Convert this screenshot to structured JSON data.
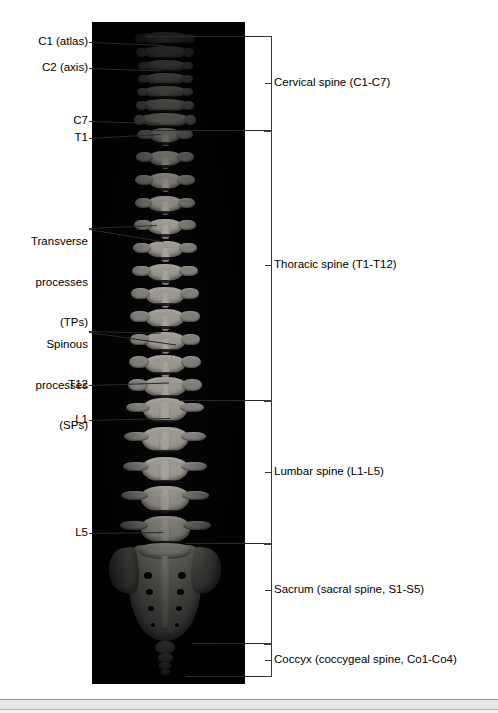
{
  "figure": {
    "background_color": "#ffffff",
    "photo_background_color": "#040404",
    "bone_color": "#8e8c87"
  },
  "left_labels": [
    {
      "id": "c1",
      "text": "C1 (atlas)",
      "lines": [
        "C1 (atlas)"
      ]
    },
    {
      "id": "c2",
      "text": "C2 (axis)",
      "lines": [
        "C2 (axis)"
      ]
    },
    {
      "id": "c7",
      "text": "C7",
      "lines": [
        "C7"
      ]
    },
    {
      "id": "t1",
      "text": "T1",
      "lines": [
        "T1"
      ]
    },
    {
      "id": "tp",
      "text": "Transverse processes (TPs)",
      "lines": [
        "Transverse",
        "processes",
        "(TPs)"
      ]
    },
    {
      "id": "sp",
      "text": "Spinous processes (SPs)",
      "lines": [
        "Spinous",
        "processes",
        "(SPs)"
      ]
    },
    {
      "id": "t12",
      "text": "T12",
      "lines": [
        "T12"
      ]
    },
    {
      "id": "l1",
      "text": "L1",
      "lines": [
        "L1"
      ]
    },
    {
      "id": "l5",
      "text": "L5",
      "lines": [
        "L5"
      ]
    }
  ],
  "right_labels": [
    {
      "id": "cervical",
      "text": "Cervical spine (C1-C7)",
      "region": "cervical"
    },
    {
      "id": "thoracic",
      "text": "Thoracic spine (T1-T12)",
      "region": "thoracic"
    },
    {
      "id": "lumbar",
      "text": "Lumbar spine (L1-L5)",
      "region": "lumbar"
    },
    {
      "id": "sacrum",
      "text": "Sacrum (sacral spine, S1-S5)",
      "region": "sacrum"
    },
    {
      "id": "coccyx",
      "text": "Coccyx (coccygeal spine, Co1-Co4)",
      "region": "coccyx"
    }
  ],
  "regions": [
    {
      "id": "cervical",
      "label": "Cervical spine (C1-C7)",
      "vertebrae": "C1-C7",
      "count": 7
    },
    {
      "id": "thoracic",
      "label": "Thoracic spine (T1-T12)",
      "vertebrae": "T1-T12",
      "count": 12
    },
    {
      "id": "lumbar",
      "label": "Lumbar spine (L1-L5)",
      "vertebrae": "L1-L5",
      "count": 5
    },
    {
      "id": "sacrum",
      "label": "Sacrum (sacral spine, S1-S5)",
      "vertebrae": "S1-S5",
      "count": 5
    },
    {
      "id": "coccyx",
      "label": "Coccyx (coccygeal spine, Co1-Co4)",
      "vertebrae": "Co1-Co4",
      "count": 4
    }
  ]
}
